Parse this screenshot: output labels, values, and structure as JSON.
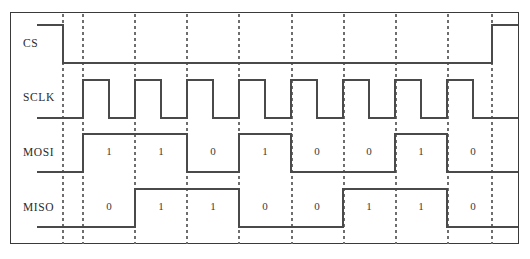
{
  "frame": {
    "x": 10,
    "y": 12,
    "width": 509,
    "height": 232,
    "border_color": "#3a3a3a"
  },
  "colors": {
    "signal": "#4a4a4a",
    "dashed_gridline": "#6e6e6e",
    "frame": "#3a3a3a",
    "text": "#2b2b2b",
    "background": "#ffffff"
  },
  "geometry": {
    "bit_start_x": 82,
    "bit_width": 52,
    "bit_count": 8,
    "cs_fall_x": 62,
    "cs_rise_x": 491,
    "lead_x": 36,
    "right_end_x": 517
  },
  "gridlines_x": [
    62,
    82,
    134,
    186,
    238,
    291,
    343,
    395,
    447,
    491
  ],
  "signals": [
    {
      "name": "CS",
      "label": "CS",
      "label_x": 22,
      "label_y": 43,
      "high_y": 24,
      "low_y": 62,
      "active_low": true,
      "description": "chip-select, idles high, asserted low during transfer"
    },
    {
      "name": "SCLK",
      "label": "SCLK",
      "label_x": 22,
      "label_y": 97,
      "high_y": 79,
      "low_y": 117,
      "pulses": 8,
      "description": "serial clock, 8 pulses"
    },
    {
      "name": "MOSI",
      "label": "MOSI",
      "label_x": 22,
      "label_y": 152,
      "high_y": 133,
      "low_y": 171,
      "bits": [
        "1",
        "1",
        "0",
        "1",
        "0",
        "0",
        "1",
        "0"
      ],
      "description": "master out slave in data"
    },
    {
      "name": "MISO",
      "label": "MISO",
      "label_x": 22,
      "label_y": 207,
      "high_y": 188,
      "low_y": 226,
      "bits": [
        "0",
        "1",
        "1",
        "0",
        "0",
        "1",
        "1",
        "0"
      ],
      "description": "master in slave out data"
    }
  ]
}
